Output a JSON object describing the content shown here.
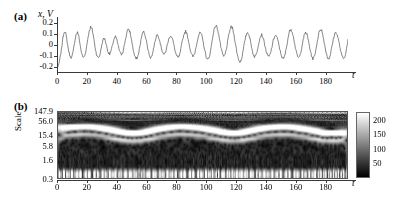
{
  "figure": {
    "panel_a_tag": "(a)",
    "panel_b_tag": "(b)"
  },
  "chart_data": [
    {
      "type": "line",
      "panel": "(a)",
      "title": "",
      "ylabel": "x, V",
      "xlabel": "t",
      "xlim": [
        0,
        195
      ],
      "ylim": [
        -0.25,
        0.25
      ],
      "grid": false,
      "legend": "none",
      "yticks": [
        "0.2",
        "0.1",
        "0",
        "-0.1",
        "-0.2"
      ],
      "ytick_values": [
        0.2,
        0.1,
        0,
        -0.1,
        -0.2
      ],
      "xticks": [
        "0",
        "20",
        "40",
        "60",
        "80",
        "100",
        "120",
        "140",
        "160",
        "180"
      ],
      "xtick_values": [
        0,
        20,
        40,
        60,
        80,
        100,
        120,
        140,
        160,
        180
      ],
      "line_color": "#555555",
      "series": [
        {
          "name": "x(t)",
          "values": [
            -0.21,
            -0.2,
            -0.13,
            -0.05,
            0.06,
            0.12,
            0.1,
            0.02,
            -0.06,
            -0.11,
            -0.12,
            -0.07,
            0.02,
            0.09,
            0.11,
            0.07,
            -0.02,
            -0.09,
            -0.12,
            -0.1,
            -0.04,
            0.05,
            0.12,
            0.16,
            0.14,
            0.07,
            -0.02,
            -0.09,
            -0.12,
            -0.11,
            -0.05,
            0.02,
            0.06,
            0.04,
            -0.02,
            -0.07,
            -0.09,
            -0.06,
            0.0,
            0.05,
            0.07,
            0.04,
            -0.02,
            -0.07,
            -0.09,
            -0.07,
            -0.01,
            0.06,
            0.12,
            0.14,
            0.11,
            0.04,
            -0.04,
            -0.1,
            -0.13,
            -0.12,
            -0.07,
            0.01,
            0.08,
            0.12,
            0.1,
            0.04,
            -0.03,
            -0.09,
            -0.12,
            -0.1,
            -0.04,
            0.03,
            0.08,
            0.09,
            0.05,
            -0.01,
            -0.06,
            -0.09,
            -0.08,
            -0.03,
            0.03,
            0.07,
            0.08,
            0.05,
            -0.01,
            -0.07,
            -0.11,
            -0.12,
            -0.09,
            -0.02,
            0.05,
            0.1,
            0.12,
            0.09,
            0.03,
            -0.04,
            -0.09,
            -0.11,
            -0.09,
            -0.03,
            0.04,
            0.09,
            0.11,
            0.08,
            0.02,
            -0.05,
            -0.11,
            -0.14,
            -0.12,
            -0.06,
            0.03,
            0.11,
            0.16,
            0.17,
            0.13,
            0.06,
            -0.02,
            -0.08,
            -0.11,
            -0.09,
            -0.03,
            0.05,
            0.12,
            0.16,
            0.15,
            0.09,
            0.01,
            -0.07,
            -0.13,
            -0.16,
            -0.14,
            -0.08,
            0.0,
            0.07,
            0.11,
            0.1,
            0.05,
            -0.02,
            -0.08,
            -0.11,
            -0.1,
            -0.05,
            0.02,
            0.07,
            0.09,
            0.06,
            0.0,
            -0.06,
            -0.1,
            -0.11,
            -0.08,
            -0.02,
            0.04,
            0.08,
            0.08,
            0.04,
            -0.02,
            -0.08,
            -0.12,
            -0.13,
            -0.09,
            -0.02,
            0.06,
            0.12,
            0.14,
            0.11,
            0.05,
            -0.03,
            -0.09,
            -0.12,
            -0.11,
            -0.05,
            0.02,
            0.08,
            0.11,
            0.09,
            0.03,
            -0.04,
            -0.1,
            -0.13,
            -0.11,
            -0.05,
            0.03,
            0.1,
            0.14,
            0.13,
            0.07,
            0.0,
            -0.07,
            -0.12,
            -0.13,
            -0.09,
            -0.02,
            0.05,
            0.1,
            0.11,
            0.07,
            0.01,
            -0.06,
            -0.11,
            -0.13,
            -0.1,
            -0.04,
            0.04
          ]
        }
      ]
    },
    {
      "type": "heatmap",
      "panel": "(b)",
      "title": "",
      "ylabel": "Scale",
      "xlabel": "t",
      "xlim": [
        0,
        195
      ],
      "xticks": [
        "0",
        "20",
        "40",
        "60",
        "80",
        "100",
        "120",
        "140",
        "160",
        "180"
      ],
      "xtick_values": [
        0,
        20,
        40,
        60,
        80,
        100,
        120,
        140,
        160,
        180
      ],
      "yticks": [
        "147.9",
        "56.0",
        "15.4",
        "5.8",
        "1.6",
        "0.3"
      ],
      "ytick_values": [
        147.9,
        56.0,
        15.4,
        5.8,
        1.6,
        0.3
      ],
      "yscale": "log",
      "colormap": "gray",
      "colorbar": {
        "ticks": [
          "200",
          "150",
          "100",
          "50"
        ],
        "tick_values": [
          200,
          150,
          100,
          50
        ],
        "vmin": 0,
        "vmax": 230,
        "position": "right"
      }
    }
  ]
}
